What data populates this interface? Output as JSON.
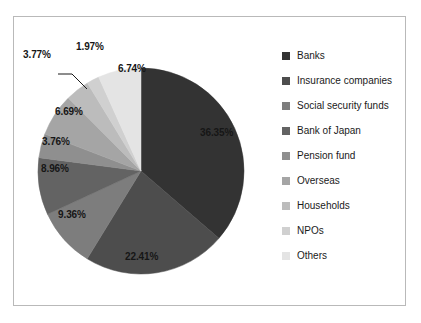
{
  "chart_data": {
    "type": "pie",
    "title": "",
    "legend_position": "right",
    "start_angle_deg": 0,
    "direction": "clockwise",
    "categories": [
      "Banks",
      "Insurance companies",
      "Social security funds",
      "Bank of Japan",
      "Pension fund",
      "Overseas",
      "Households",
      "NPOs",
      "Others"
    ],
    "values": [
      36.35,
      22.41,
      9.36,
      8.96,
      3.76,
      6.69,
      3.77,
      1.97,
      6.74
    ],
    "value_labels": [
      "36.35%",
      "22.41%",
      "9.36%",
      "8.96%",
      "3.76%",
      "6.69%",
      "3.77%",
      "1.97%",
      "6.74%"
    ],
    "colors": [
      "#333333",
      "#4d4d4d",
      "#7d7d7d",
      "#636363",
      "#8f8f8f",
      "#a5a5a5",
      "#bcbcbc",
      "#d0d0d0",
      "#e4e4e4"
    ],
    "unit": "percent",
    "grid": false
  },
  "frame": {
    "border_color": "#b9b9b9",
    "background": "#ffffff"
  },
  "legend": {
    "items": [
      {
        "label": "Banks",
        "color": "#333333"
      },
      {
        "label": "Insurance companies",
        "color": "#4d4d4d"
      },
      {
        "label": "Social security funds",
        "color": "#7d7d7d"
      },
      {
        "label": "Bank of Japan",
        "color": "#636363"
      },
      {
        "label": "Pension fund",
        "color": "#8f8f8f"
      },
      {
        "label": "Overseas",
        "color": "#a5a5a5"
      },
      {
        "label": "Households",
        "color": "#bcbcbc"
      },
      {
        "label": "NPOs",
        "color": "#d0d0d0"
      },
      {
        "label": "Others",
        "color": "#e4e4e4"
      }
    ]
  },
  "labels": {
    "banks": "36.35%",
    "insurance": "22.41%",
    "social_security": "9.36%",
    "boj": "8.96%",
    "pension": "3.76%",
    "overseas": "6.69%",
    "households": "3.77%",
    "npos": "1.97%",
    "others": "6.74%"
  }
}
